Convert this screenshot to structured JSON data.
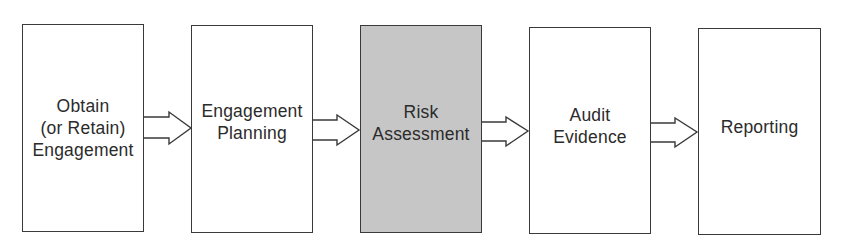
{
  "diagram": {
    "type": "process-flow",
    "stages": [
      {
        "id": "obtain-engagement",
        "label": "Obtain\n(or Retain)\nEngagement",
        "highlighted": false
      },
      {
        "id": "engagement-planning",
        "label": "Engagement\nPlanning",
        "highlighted": false
      },
      {
        "id": "risk-assessment",
        "label": "Risk\nAssessment",
        "highlighted": true
      },
      {
        "id": "audit-evidence",
        "label": "Audit\nEvidence",
        "highlighted": false
      },
      {
        "id": "reporting",
        "label": "Reporting",
        "highlighted": false
      }
    ],
    "connectors": [
      {
        "from": "obtain-engagement",
        "to": "engagement-planning",
        "style": "hollow-block-arrow"
      },
      {
        "from": "engagement-planning",
        "to": "risk-assessment",
        "style": "hollow-block-arrow"
      },
      {
        "from": "risk-assessment",
        "to": "audit-evidence",
        "style": "hollow-block-arrow"
      },
      {
        "from": "audit-evidence",
        "to": "reporting",
        "style": "hollow-block-arrow"
      }
    ],
    "colors": {
      "box_border": "#3a3a3a",
      "box_fill": "#ffffff",
      "highlight_fill": "#c6c6c6",
      "text": "#2b2b2b"
    }
  }
}
